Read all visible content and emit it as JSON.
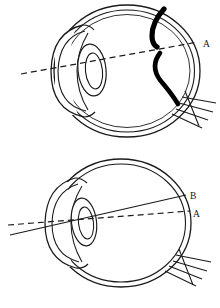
{
  "figure": {
    "type": "medical-illustration",
    "title": "",
    "line_color": "#1a1a1a",
    "detachment_color": "#000000",
    "background_color": "#ffffff",
    "panels": [
      {
        "id": "top",
        "name": "eye-with-retinal-detachment",
        "labels": [
          {
            "id": "A",
            "text": "A",
            "x": 207,
            "y": 43,
            "axis": "dashed"
          }
        ],
        "axes": [
          {
            "id": "A",
            "style": "dashed",
            "label": "A"
          }
        ],
        "features": [
          "sclera",
          "choroid",
          "cornea",
          "iris",
          "lens",
          "optic-nerve",
          "detached-retina"
        ]
      },
      {
        "id": "bottom",
        "name": "eye-with-two-axes",
        "labels": [
          {
            "id": "B",
            "text": "B",
            "x": 193,
            "y": 195,
            "axis": "solid"
          },
          {
            "id": "A",
            "text": "A",
            "x": 196,
            "y": 213,
            "axis": "dashed"
          }
        ],
        "axes": [
          {
            "id": "B",
            "style": "solid",
            "label": "B"
          },
          {
            "id": "A",
            "style": "dashed",
            "label": "A"
          }
        ],
        "features": [
          "sclera",
          "choroid",
          "cornea",
          "iris",
          "lens",
          "optic-nerve"
        ]
      }
    ]
  }
}
